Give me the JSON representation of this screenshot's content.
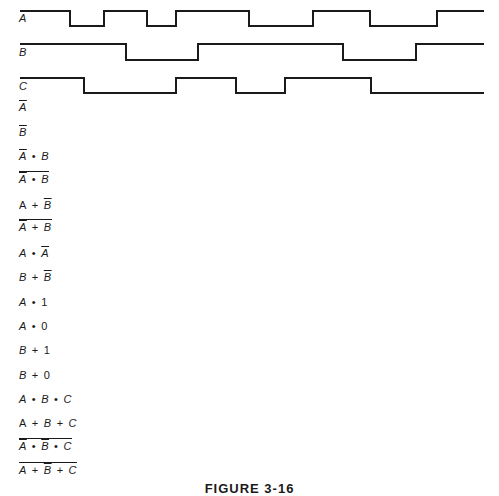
{
  "signals": [
    {
      "name": "A",
      "label_y": 19,
      "high_y": 11,
      "low_y": 26,
      "edges": [
        [
          20,
          "H"
        ],
        [
          70,
          "L"
        ],
        [
          104,
          "H"
        ],
        [
          147,
          "L"
        ],
        [
          176,
          "H"
        ],
        [
          249,
          "L"
        ],
        [
          313,
          "H"
        ],
        [
          370,
          "L"
        ],
        [
          437,
          "H"
        ],
        [
          484,
          "H"
        ]
      ]
    },
    {
      "name": "B",
      "label_y": 52,
      "high_y": 44,
      "low_y": 60,
      "edges": [
        [
          20,
          "H"
        ],
        [
          126,
          "L"
        ],
        [
          198,
          "H"
        ],
        [
          343,
          "L"
        ],
        [
          416,
          "H"
        ],
        [
          484,
          "H"
        ]
      ]
    },
    {
      "name": "C",
      "label_y": 86,
      "high_y": 78,
      "low_y": 93,
      "edges": [
        [
          20,
          "H"
        ],
        [
          84,
          "L"
        ],
        [
          176,
          "H"
        ],
        [
          236,
          "L"
        ],
        [
          285,
          "H"
        ],
        [
          371,
          "L"
        ],
        [
          484,
          "L"
        ]
      ]
    }
  ],
  "labels": {
    "a": "A",
    "b": "B",
    "c": "C"
  },
  "expressions": [
    {
      "id": "not-a",
      "text": "Ā"
    },
    {
      "id": "not-b",
      "text": "B̄"
    },
    {
      "id": "not-a-and-b",
      "text": "Ā • B"
    },
    {
      "id": "nand-not-a-b",
      "text": "NOT(Ā • B)"
    },
    {
      "id": "a-or-not-b",
      "text": "A + B̄"
    },
    {
      "id": "nor-not-a-b",
      "text": "NOT(Ā + B)"
    },
    {
      "id": "a-and-not-a",
      "text": "A • Ā"
    },
    {
      "id": "b-or-not-b",
      "text": "B + B̄"
    },
    {
      "id": "a-and-1",
      "text": "A • 1"
    },
    {
      "id": "a-and-0",
      "text": "A • 0"
    },
    {
      "id": "b-or-1",
      "text": "B + 1"
    },
    {
      "id": "b-or-0",
      "text": "B + 0"
    },
    {
      "id": "a-and-b-and-c",
      "text": "A • B • C"
    },
    {
      "id": "a-or-b-or-c",
      "text": "A + B + C"
    },
    {
      "id": "nand-not-a-not-b-c",
      "text": "NOT(Ā • B̄ • C)"
    },
    {
      "id": "nor-a-not-b-c",
      "text": "NOT(A + B̄ + C)"
    }
  ],
  "tokens": {
    "A": "A",
    "B": "B",
    "C": "C",
    "and": "•",
    "or": "+",
    "one": "1",
    "zero": "0"
  },
  "caption": "FIGURE 3-16",
  "colors": {
    "ink": "#1a1a1a",
    "background": "#ffffff"
  }
}
